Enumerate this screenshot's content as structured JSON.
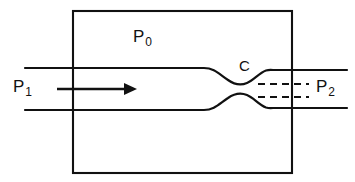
{
  "figure": {
    "domain": "Diagram",
    "background_color": "#ffffff",
    "line_color": "#111111",
    "width": 355,
    "height": 182
  },
  "labels": {
    "plenum_pressure": {
      "symbol": "P",
      "subscript": "0",
      "name": "stagnation-or-plenum-pressure"
    },
    "inlet_pressure": {
      "symbol": "P",
      "subscript": "1",
      "name": "upstream-pressure"
    },
    "outlet_pressure": {
      "symbol": "P",
      "subscript": "2",
      "name": "downstream-pressure"
    },
    "contraction_point": {
      "symbol": "C",
      "name": "vena-contracta-point"
    }
  },
  "elements": {
    "chamber": {
      "name": "plenum-chamber-rectangle",
      "x": 73,
      "y": 11,
      "width": 219,
      "height": 162
    },
    "upper_wall_inlet": {
      "name": "upper-pipe-wall-inlet",
      "y": 68,
      "x_start": 25,
      "x_end": 205
    },
    "lower_wall_inlet": {
      "name": "lower-pipe-wall-inlet",
      "y": 110,
      "x_start": 25,
      "x_end": 205
    },
    "upper_wall_outlet": {
      "name": "upper-pipe-wall-outlet",
      "y": 70,
      "x_start": 272,
      "x_end": 347
    },
    "lower_wall_outlet": {
      "name": "lower-pipe-wall-outlet",
      "y": 108,
      "x_start": 272,
      "x_end": 347
    },
    "throat": {
      "name": "throat-constriction",
      "center_x": 246,
      "upper_y": 82,
      "lower_y": 96
    },
    "flow_arrow": {
      "name": "flow-direction-arrow",
      "y": 89,
      "x_start": 57,
      "x_end": 136
    },
    "dashed_upper": {
      "name": "dashed-streamline-upper",
      "y": 84,
      "x_start": 258,
      "x_end": 309
    },
    "dashed_lower": {
      "name": "dashed-streamline-lower",
      "y": 97,
      "x_start": 258,
      "x_end": 309
    }
  }
}
